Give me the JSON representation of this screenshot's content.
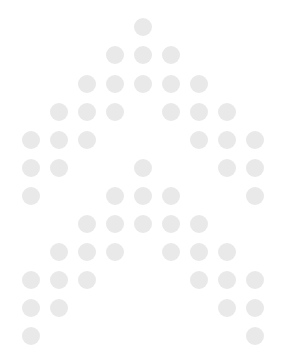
{
  "canvas": {
    "width": 288,
    "height": 354,
    "background_color": "#ffffff",
    "title": "Dot matrix arrow glyph"
  },
  "glyph": {
    "name": "upward-arrow-dot-matrix",
    "description": "Halftone dot-matrix rendering of an upward pointing arrow / chevron outline",
    "dot_color": "#e9e9e9",
    "dot_diameter": 18,
    "grid_spacing_x": 28,
    "grid_spacing_y": 28,
    "origin_x": 143,
    "origin_y": 27,
    "total_dots": 48
  },
  "chart_data": {
    "type": "scatter",
    "xlabel": "",
    "ylabel": "",
    "xlim": [
      0,
      288
    ],
    "ylim": [
      354,
      0
    ],
    "grid": false,
    "legend": null,
    "marker": "circle",
    "marker_size": 18,
    "marker_color": "#e9e9e9",
    "rows": [
      {
        "row": 1,
        "y": 27,
        "x": [
          143
        ]
      },
      {
        "row": 2,
        "y": 55,
        "x": [
          115,
          143,
          171
        ]
      },
      {
        "row": 3,
        "y": 84,
        "x": [
          87,
          115,
          143,
          171,
          199
        ]
      },
      {
        "row": 4,
        "y": 112,
        "x": [
          59,
          87,
          115,
          171,
          199,
          227
        ]
      },
      {
        "row": 5,
        "y": 140,
        "x": [
          31,
          59,
          87,
          199,
          227,
          255
        ]
      },
      {
        "row": 6,
        "y": 168,
        "x": [
          31,
          59,
          143,
          227,
          255
        ]
      },
      {
        "row": 7,
        "y": 196,
        "x": [
          31,
          115,
          143,
          171,
          255
        ]
      },
      {
        "row": 8,
        "y": 224,
        "x": [
          87,
          115,
          143,
          171,
          199
        ]
      },
      {
        "row": 9,
        "y": 252,
        "x": [
          59,
          87,
          115,
          171,
          199,
          227
        ]
      },
      {
        "row": 10,
        "y": 280,
        "x": [
          31,
          59,
          87,
          199,
          227,
          255
        ]
      },
      {
        "row": 11,
        "y": 308,
        "x": [
          31,
          59,
          227,
          255
        ]
      },
      {
        "row": 12,
        "y": 336,
        "x": [
          31,
          255
        ]
      }
    ]
  }
}
